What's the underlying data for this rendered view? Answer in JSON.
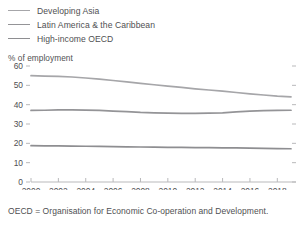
{
  "legend": {
    "items": [
      {
        "label": "Developing Asia",
        "color": "#a6a6a9"
      },
      {
        "label": "Latin America & the Caribbean",
        "color": "#949497"
      },
      {
        "label": "High-income OECD",
        "color": "#8e8e91"
      }
    ]
  },
  "axis_title": "% of employment",
  "footnote": "OECD = Organisation for Economic Co-operation and Development.",
  "chart_data": {
    "type": "line",
    "title": "",
    "subtitle": "",
    "xlabel": "",
    "ylabel": "% of employment",
    "xlim": [
      2000,
      2019
    ],
    "ylim": [
      0,
      60
    ],
    "ytick_values": [
      0,
      10,
      20,
      30,
      40,
      50,
      60
    ],
    "ytick_labels": [
      "0",
      "10",
      "20",
      "30",
      "40",
      "50",
      "60"
    ],
    "xtick_values": [
      2000,
      2002,
      2004,
      2006,
      2008,
      2010,
      2012,
      2014,
      2016,
      2018
    ],
    "xtick_labels": [
      "2000",
      "2002",
      "2004",
      "2006",
      "2008",
      "2010",
      "2012",
      "2014",
      "2016",
      "2018"
    ],
    "grid": false,
    "legend_position": "above-left",
    "x": [
      2000,
      2001,
      2002,
      2003,
      2004,
      2005,
      2006,
      2007,
      2008,
      2009,
      2010,
      2011,
      2012,
      2013,
      2014,
      2015,
      2016,
      2017,
      2018,
      2019
    ],
    "series": [
      {
        "name": "Developing Asia",
        "color": "#a6a6a9",
        "values": [
          55.0,
          54.8,
          54.6,
          54.3,
          53.8,
          53.2,
          52.5,
          51.8,
          51.0,
          50.3,
          49.6,
          48.9,
          48.2,
          47.6,
          47.0,
          46.3,
          45.6,
          45.0,
          44.4,
          44.0
        ]
      },
      {
        "name": "Latin America & the Caribbean",
        "color": "#949497",
        "values": [
          37.0,
          37.1,
          37.3,
          37.3,
          37.2,
          37.0,
          36.7,
          36.4,
          36.0,
          35.8,
          35.6,
          35.5,
          35.5,
          35.6,
          35.8,
          36.3,
          36.7,
          36.9,
          37.0,
          37.1
        ]
      },
      {
        "name": "High-income OECD",
        "color": "#8e8e91",
        "values": [
          18.8,
          18.7,
          18.7,
          18.6,
          18.5,
          18.4,
          18.3,
          18.2,
          18.1,
          18.0,
          17.9,
          17.9,
          17.8,
          17.8,
          17.7,
          17.6,
          17.5,
          17.4,
          17.3,
          17.2
        ]
      }
    ]
  }
}
